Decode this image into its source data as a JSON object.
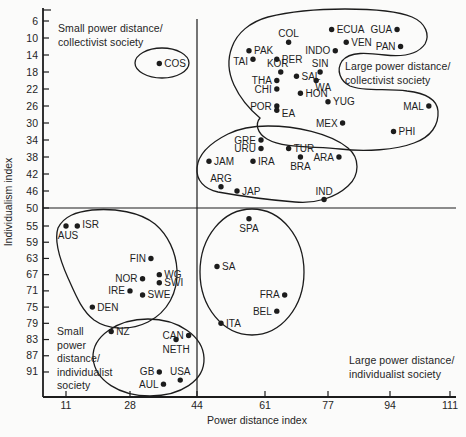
{
  "chart_data": {
    "type": "scatter",
    "title": "",
    "xlabel": "Power distance index",
    "ylabel": "Individualism index",
    "x_ticks": [
      11,
      28,
      44,
      61,
      77,
      94,
      111
    ],
    "y_ticks": [
      6,
      10,
      14,
      18,
      22,
      26,
      30,
      34,
      38,
      42,
      46,
      50,
      55,
      59,
      63,
      67,
      71,
      75,
      79,
      83,
      87,
      91
    ],
    "y_axis_inverted": true,
    "grid": false,
    "divider": {
      "x_value": 44,
      "y_value": 50
    },
    "quadrant_labels": {
      "top_left": [
        "Small power distance/",
        "collectivist society"
      ],
      "top_right": [
        "Large power distance/",
        "collectivist society"
      ],
      "bottom_left": [
        "Small",
        "power",
        "distance/",
        "individualist",
        "society"
      ],
      "bottom_right": [
        "Large power distance/",
        "individualist society"
      ]
    },
    "points": [
      {
        "label": "COS",
        "x": 35,
        "y": 16,
        "lp": "right"
      },
      {
        "label": "PAK",
        "x": 57,
        "y": 13,
        "lp": "right"
      },
      {
        "label": "COL",
        "x": 67,
        "y": 11,
        "lp": "above"
      },
      {
        "label": "ECUA",
        "x": 78,
        "y": 8,
        "lp": "right"
      },
      {
        "label": "GUA",
        "x": 96,
        "y": 8,
        "lp": "left"
      },
      {
        "label": "VEN",
        "x": 82,
        "y": 11,
        "lp": "right"
      },
      {
        "label": "PAN",
        "x": 97,
        "y": 12,
        "lp": "left"
      },
      {
        "label": "INDO",
        "x": 79,
        "y": 13,
        "lp": "left"
      },
      {
        "label": "TAI",
        "x": 58,
        "y": 15,
        "lp": "left",
        "dy": 2
      },
      {
        "label": "PER",
        "x": 64,
        "y": 15,
        "lp": "right"
      },
      {
        "label": "KOR",
        "x": 65,
        "y": 18,
        "lp": "above",
        "dx": -3
      },
      {
        "label": "SIN",
        "x": 75,
        "y": 18,
        "lp": "above"
      },
      {
        "label": "SAL",
        "x": 69,
        "y": 19,
        "lp": "right"
      },
      {
        "label": "THA",
        "x": 64,
        "y": 20,
        "lp": "left"
      },
      {
        "label": "CHI",
        "x": 64,
        "y": 22,
        "lp": "left"
      },
      {
        "label": "WA",
        "x": 74,
        "y": 20,
        "lp": "below",
        "dx": 7,
        "dy": -3
      },
      {
        "label": "HON",
        "x": 70,
        "y": 23,
        "lp": "right"
      },
      {
        "label": "POR",
        "x": 64,
        "y": 26,
        "lp": "left"
      },
      {
        "label": "YUG",
        "x": 77,
        "y": 25,
        "lp": "right"
      },
      {
        "label": "EA",
        "x": 64,
        "y": 27,
        "lp": "right",
        "dy": 3
      },
      {
        "label": "MAL",
        "x": 105,
        "y": 26,
        "lp": "left"
      },
      {
        "label": "MEX",
        "x": 81,
        "y": 30,
        "lp": "left"
      },
      {
        "label": "PHI",
        "x": 95,
        "y": 32,
        "lp": "right"
      },
      {
        "label": "GRE",
        "x": 60,
        "y": 34,
        "lp": "left"
      },
      {
        "label": "URU",
        "x": 60,
        "y": 36,
        "lp": "left"
      },
      {
        "label": "TUR",
        "x": 67,
        "y": 36,
        "lp": "right"
      },
      {
        "label": "BRA",
        "x": 70,
        "y": 38,
        "lp": "below"
      },
      {
        "label": "ARA",
        "x": 80,
        "y": 38,
        "lp": "left"
      },
      {
        "label": "IRA",
        "x": 58,
        "y": 39,
        "lp": "right"
      },
      {
        "label": "JAM",
        "x": 47,
        "y": 39,
        "lp": "right"
      },
      {
        "label": "ARG",
        "x": 50,
        "y": 45,
        "lp": "above"
      },
      {
        "label": "JAP",
        "x": 54,
        "y": 46,
        "lp": "right"
      },
      {
        "label": "IND",
        "x": 76,
        "y": 48,
        "lp": "above"
      },
      {
        "label": "ISR",
        "x": 14,
        "y": 55,
        "lp": "right",
        "dy": -2
      },
      {
        "label": "AUS",
        "x": 11,
        "y": 55,
        "lp": "below",
        "dx": 2
      },
      {
        "label": "SPA",
        "x": 57,
        "y": 53,
        "lp": "below"
      },
      {
        "label": "FIN",
        "x": 33,
        "y": 63,
        "lp": "left"
      },
      {
        "label": "WG",
        "x": 35,
        "y": 67,
        "lp": "right"
      },
      {
        "label": "NOR",
        "x": 31,
        "y": 68,
        "lp": "left"
      },
      {
        "label": "SWI",
        "x": 35,
        "y": 69,
        "lp": "right"
      },
      {
        "label": "IRE",
        "x": 28,
        "y": 71,
        "lp": "left"
      },
      {
        "label": "SWE",
        "x": 31,
        "y": 72,
        "lp": "right"
      },
      {
        "label": "SA",
        "x": 49,
        "y": 65,
        "lp": "right"
      },
      {
        "label": "DEN",
        "x": 18,
        "y": 75,
        "lp": "right"
      },
      {
        "label": "FRA",
        "x": 66,
        "y": 72,
        "lp": "left"
      },
      {
        "label": "BEL",
        "x": 64,
        "y": 76,
        "lp": "left"
      },
      {
        "label": "NZ",
        "x": 23,
        "y": 81,
        "lp": "right"
      },
      {
        "label": "CAN",
        "x": 42,
        "y": 82,
        "lp": "left"
      },
      {
        "label": "NETH",
        "x": 39,
        "y": 83,
        "lp": "below"
      },
      {
        "label": "ITA",
        "x": 50,
        "y": 79,
        "lp": "right"
      },
      {
        "label": "GB",
        "x": 35,
        "y": 91,
        "lp": "left"
      },
      {
        "label": "USA",
        "x": 40,
        "y": 93,
        "lp": "above"
      },
      {
        "label": "AUL",
        "x": 36,
        "y": 94,
        "lp": "left"
      }
    ],
    "clusters": [
      {
        "name": "costa-rica",
        "members": [
          "COS"
        ],
        "path": "M135,63 C135,55 147,48 162,48 C177,48 189,55 189,63 C189,71 177,78 162,78 C147,78 135,71 135,63 Z"
      },
      {
        "name": "large-pd-collectivist",
        "members": [
          "PAK",
          "COL",
          "ECUA",
          "GUA",
          "VEN",
          "PAN",
          "INDO",
          "TAI",
          "PER",
          "KOR",
          "SIN",
          "SAL",
          "THA",
          "CHI",
          "WA",
          "HON",
          "POR",
          "YUG",
          "EA",
          "MAL",
          "MEX",
          "PHI"
        ],
        "path": "M268,17 C250,22 237,33 232,47 C227,60 228,72 234,85 C240,98 248,108 260,118 C255,124 257,133 267,139 C284,149 315,146 340,149 C365,152 396,150 414,143 C431,137 439,125 438,111 C437,98 424,93 407,91 C388,88 364,92 350,86 C340,81 336,70 342,61 C350,51 368,53 385,55 C403,57 418,54 425,44 C430,35 426,23 412,17 C395,10 370,9 345,9 C317,9 288,12 268,17 Z"
      },
      {
        "name": "mid-collectivist",
        "members": [
          "GRE",
          "URU",
          "TUR",
          "BRA",
          "ARA",
          "IRA",
          "JAM",
          "ARG",
          "JAP",
          "IND"
        ],
        "path": "M268,126 C295,126 330,133 348,148 C360,158 360,175 348,186 C335,198 315,204 295,202 C270,200 240,196 218,192 C204,189 196,180 197,168 C198,155 210,143 228,134 C240,128 254,126 268,126 Z"
      },
      {
        "name": "nordic-individualist",
        "members": [
          "ISR",
          "AUS",
          "FIN",
          "WG",
          "NOR",
          "SWI",
          "IRE",
          "SWE",
          "DEN"
        ],
        "path": "M92,210 C115,208 140,212 155,224 C168,235 176,252 177,270 C178,292 168,312 148,322 C130,331 108,330 94,320 C82,311 76,296 68,278 C60,260 54,240 58,228 C64,216 76,212 92,210 Z"
      },
      {
        "name": "anglo-individualist",
        "members": [
          "NZ",
          "CAN",
          "NETH",
          "GB",
          "USA",
          "AUL"
        ],
        "path": "M148,319 C178,319 203,336 204,358 C205,381 180,396 150,396 C120,396 95,381 93,358 C92,336 118,319 148,319 Z"
      },
      {
        "name": "latin-european",
        "members": [
          "SPA",
          "SA",
          "FRA",
          "BEL",
          "ITA"
        ],
        "path": "M252,209 C281,209 304,237 304,272 C304,307 281,335 252,335 C223,335 200,307 200,272 C200,237 223,209 252,209 Z"
      }
    ],
    "colors": {
      "ink": "#1c1c1c",
      "background": "#fbfbfa"
    }
  }
}
